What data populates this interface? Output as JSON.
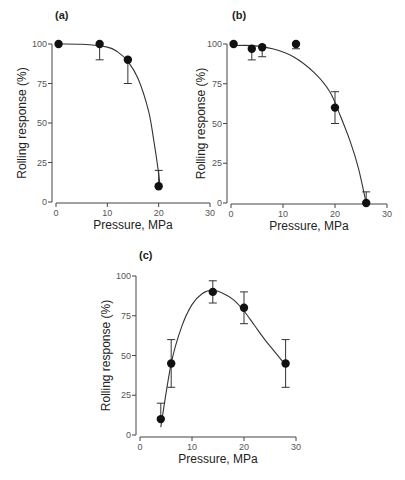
{
  "chart_data": [
    {
      "panel": "(a)",
      "type": "scatter",
      "title": "",
      "xlabel": "Pressure, MPa",
      "ylabel": "Rolling response (%)",
      "xlim": [
        0,
        30
      ],
      "ylim": [
        0,
        100
      ],
      "xticks": [
        0,
        10,
        20,
        30
      ],
      "yticks": [
        0,
        25,
        50,
        75,
        100
      ],
      "grid": false,
      "series": [
        {
          "name": "data",
          "x": [
            0.5,
            8.5,
            14,
            20
          ],
          "y": [
            100,
            100,
            90,
            10
          ],
          "err_low": [
            0,
            10,
            15,
            0
          ],
          "err_high": [
            0,
            0,
            0,
            10
          ]
        }
      ],
      "fit_curve": {
        "x": [
          0,
          5,
          10,
          12,
          14,
          16,
          18,
          19,
          20,
          20.3
        ],
        "y": [
          100,
          99.8,
          98,
          95,
          89,
          78,
          58,
          40,
          18,
          8
        ]
      }
    },
    {
      "panel": "(b)",
      "type": "scatter",
      "title": "",
      "xlabel": "Pressure, MPa",
      "ylabel": "Rolling response (%)",
      "xlim": [
        0,
        30
      ],
      "ylim": [
        0,
        100
      ],
      "xticks": [
        0,
        10,
        20,
        30
      ],
      "yticks": [
        0,
        25,
        50,
        75,
        100
      ],
      "grid": false,
      "series": [
        {
          "name": "data",
          "x": [
            0.5,
            4,
            6,
            12.5,
            20,
            26
          ],
          "y": [
            100,
            97,
            98,
            100,
            60,
            0
          ],
          "err_low": [
            0,
            7,
            6,
            3,
            10,
            0
          ],
          "err_high": [
            0,
            0,
            0,
            0,
            10,
            7
          ]
        }
      ],
      "fit_curve": {
        "x": [
          0,
          4,
          8,
          12,
          16,
          19,
          21,
          23,
          24.5,
          26
        ],
        "y": [
          99,
          99,
          97,
          92,
          82,
          70,
          55,
          38,
          22,
          0
        ]
      }
    },
    {
      "panel": "(c)",
      "type": "scatter",
      "title": "",
      "xlabel": "Pressure, MPa",
      "ylabel": "Rolling response (%)",
      "xlim": [
        0,
        30
      ],
      "ylim": [
        0,
        100
      ],
      "xticks": [
        0,
        10,
        20,
        30
      ],
      "yticks": [
        0,
        25,
        50,
        75,
        100
      ],
      "grid": false,
      "series": [
        {
          "name": "data",
          "x": [
            4,
            6,
            14,
            20,
            28
          ],
          "y": [
            10,
            45,
            90,
            80,
            45
          ],
          "err_low": [
            0,
            15,
            7,
            10,
            15
          ],
          "err_high": [
            10,
            15,
            7,
            10,
            15
          ]
        }
      ],
      "fit_curve": {
        "x": [
          4,
          6,
          8,
          10,
          12,
          14,
          16,
          18,
          20,
          22,
          24,
          26,
          28
        ],
        "y": [
          5,
          45,
          68,
          82,
          89,
          91,
          89,
          85,
          78,
          69,
          60,
          52,
          44
        ]
      }
    }
  ]
}
